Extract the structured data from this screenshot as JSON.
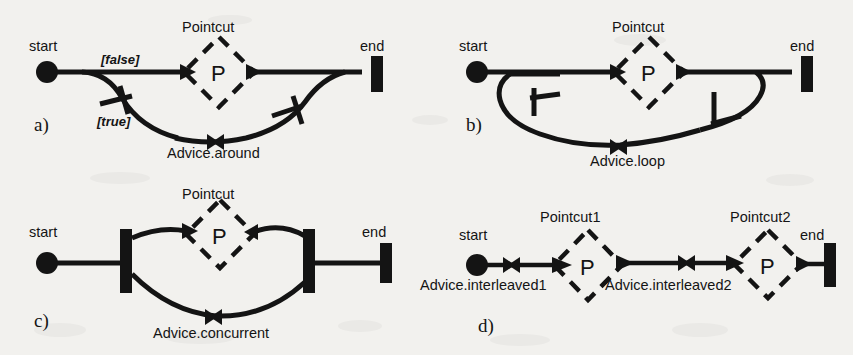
{
  "figure": {
    "kind": "activity-diagram-figure",
    "background_color": "#f2f1ee",
    "ink_color": "#141414",
    "width": 853,
    "height": 355
  },
  "common": {
    "start_label": "start",
    "end_label": "end",
    "pointcut_glyph": "P"
  },
  "panels": [
    {
      "id": "a",
      "panel_label": "a)",
      "pointcut_label": "Pointcut",
      "start_label": "start",
      "end_label": "end",
      "pointcut_glyph": "P",
      "advice_label": "Advice.around",
      "guard_false": "[false]",
      "guard_true": "[true]"
    },
    {
      "id": "b",
      "panel_label": "b)",
      "pointcut_label": "Pointcut",
      "start_label": "start",
      "end_label": "end",
      "pointcut_glyph": "P",
      "advice_label": "Advice.loop"
    },
    {
      "id": "c",
      "panel_label": "c)",
      "pointcut_label": "Pointcut",
      "start_label": "start",
      "end_label": "end",
      "pointcut_glyph": "P",
      "advice_label": "Advice.concurrent"
    },
    {
      "id": "d",
      "panel_label": "d)",
      "pointcut_label_1": "Pointcut1",
      "pointcut_label_2": "Pointcut2",
      "start_label": "start",
      "end_label": "end",
      "pointcut_glyph_1": "P",
      "pointcut_glyph_2": "P",
      "advice_label_1": "Advice.interleaved1",
      "advice_label_2": "Advice.interleaved2"
    }
  ]
}
